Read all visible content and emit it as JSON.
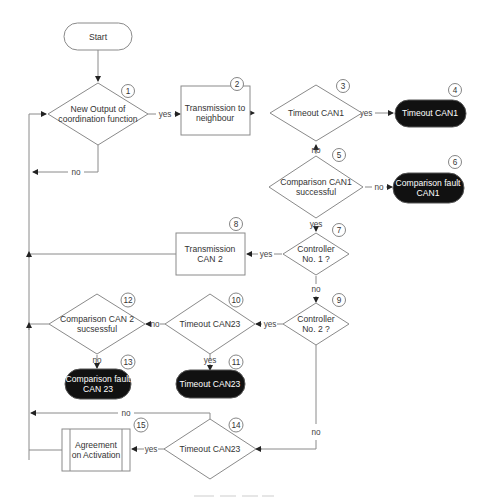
{
  "diagram": {
    "type": "flowchart",
    "nodes": {
      "start": {
        "label": "Start",
        "shape": "terminal"
      },
      "n1": {
        "id": "1",
        "line1": "New Output of",
        "line2": "coordination function",
        "shape": "decision"
      },
      "n2": {
        "id": "2",
        "line1": "Transmission to",
        "line2": "neighbour",
        "shape": "process"
      },
      "n3": {
        "id": "3",
        "label": "Timeout CAN1",
        "shape": "decision"
      },
      "n4": {
        "id": "4",
        "label": "Timeout CAN1",
        "shape": "terminal-dark"
      },
      "n5": {
        "id": "5",
        "line1": "Comparison CAN1",
        "line2": "successful",
        "shape": "decision"
      },
      "n6": {
        "id": "6",
        "line1": "Comparison fault",
        "line2": "CAN1",
        "shape": "terminal-dark"
      },
      "n7": {
        "id": "7",
        "line1": "Controller",
        "line2": "No. 1 ?",
        "shape": "decision"
      },
      "n8": {
        "id": "8",
        "line1": "Transmission",
        "line2": "CAN 2",
        "shape": "process"
      },
      "n9": {
        "id": "9",
        "line1": "Controller",
        "line2": "No. 2 ?",
        "shape": "decision"
      },
      "n10": {
        "id": "10",
        "label": "Timeout CAN23",
        "shape": "decision"
      },
      "n11": {
        "id": "11",
        "label": "Timeout CAN23",
        "shape": "terminal-dark"
      },
      "n12": {
        "id": "12",
        "line1": "Comparison CAN 2",
        "line2": "sucsessful",
        "shape": "decision"
      },
      "n13": {
        "id": "13",
        "line1": "Comparison fault",
        "line2": "CAN 23",
        "shape": "terminal-dark"
      },
      "n14": {
        "id": "14",
        "label": "Timeout CAN23",
        "shape": "decision"
      },
      "n15": {
        "id": "15",
        "line1": "Agreement",
        "line2": "on Activation",
        "shape": "predefined-process"
      }
    },
    "edge_labels": {
      "n1_yes": "yes",
      "n1_no": "no",
      "n3_yes": "yes",
      "n3_no": "no",
      "n5_no": "no",
      "n5_yes": "yes",
      "n7_yes": "yes",
      "n7_no": "no",
      "n9_yes": "yes",
      "n9_no": "no",
      "n10_no": "no",
      "n10_yes": "yes",
      "n12_no": "no",
      "n14_yes": "yes",
      "n14_no": "no"
    },
    "edges": [
      [
        "start",
        "n1",
        ""
      ],
      [
        "n1",
        "n2",
        "yes"
      ],
      [
        "n1",
        "n1",
        "no"
      ],
      [
        "n2",
        "n3",
        ""
      ],
      [
        "n3",
        "n4",
        "yes"
      ],
      [
        "n3",
        "n5",
        "no"
      ],
      [
        "n5",
        "n6",
        "no"
      ],
      [
        "n5",
        "n7",
        "yes"
      ],
      [
        "n7",
        "n8",
        "yes"
      ],
      [
        "n7",
        "n9",
        "no"
      ],
      [
        "n8",
        "n1",
        ""
      ],
      [
        "n9",
        "n10",
        "yes"
      ],
      [
        "n9",
        "n14",
        "no"
      ],
      [
        "n10",
        "n12",
        "no"
      ],
      [
        "n10",
        "n11",
        "yes"
      ],
      [
        "n12",
        "n13",
        "no"
      ],
      [
        "n12",
        "n1",
        ""
      ],
      [
        "n14",
        "n15",
        "yes"
      ],
      [
        "n14",
        "n1",
        "no"
      ],
      [
        "n15",
        "n1",
        ""
      ]
    ],
    "colors": {
      "line": "#8a8a8a",
      "terminal_dark_fill": "#111111",
      "terminal_dark_text": "#ffffff",
      "text": "#333333"
    }
  }
}
